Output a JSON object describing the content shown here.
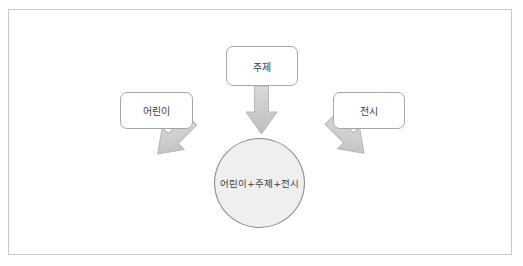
{
  "diagram": {
    "title_text": "",
    "type": "convergence-diagram",
    "frame": {
      "border_color": "#c9c9c9",
      "background": "#ffffff"
    },
    "nodes": [
      {
        "id": "children",
        "label": "어린이",
        "shape": "rounded-rectangle",
        "position": "left",
        "fill": "#ffffff",
        "border_color": "#a6a6a6"
      },
      {
        "id": "subject",
        "label": "주제",
        "shape": "rounded-rectangle",
        "position": "top-center",
        "fill": "#ffffff",
        "border_color": "#a6a6a6"
      },
      {
        "id": "exhibition",
        "label": "전시",
        "shape": "rounded-rectangle",
        "position": "right",
        "fill": "#ffffff",
        "border_color": "#a6a6a6"
      }
    ],
    "result": {
      "id": "combined",
      "label": "어린이+주제+전시",
      "shape": "circle",
      "fill": "#efefef",
      "border_color": "#8c8c8c"
    },
    "arrows": [
      {
        "id": "children-to-result",
        "from": "children",
        "to": "combined",
        "direction": "down-right",
        "style": "block-arrow",
        "fill": "#cfcfcf",
        "border_color": "#b5b5b5"
      },
      {
        "id": "subject-to-result",
        "from": "subject",
        "to": "combined",
        "direction": "down",
        "style": "block-arrow",
        "fill": "#cfcfcf",
        "border_color": "#b5b5b5"
      },
      {
        "id": "exhibition-to-result",
        "from": "exhibition",
        "to": "combined",
        "direction": "down-left",
        "style": "block-arrow",
        "fill": "#cfcfcf",
        "border_color": "#b5b5b5"
      }
    ]
  }
}
